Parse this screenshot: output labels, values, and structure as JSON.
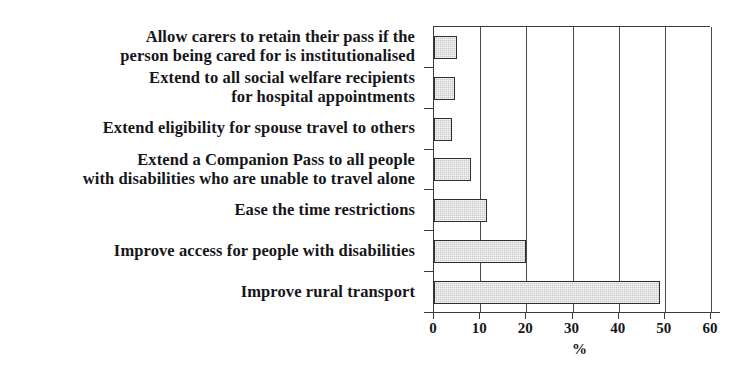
{
  "chart_data": {
    "type": "bar",
    "orientation": "horizontal",
    "title": "",
    "xlabel": "%",
    "ylabel": "",
    "xlim": [
      0,
      60
    ],
    "xticks": [
      0,
      10,
      20,
      30,
      40,
      50,
      60
    ],
    "xtick_labels": [
      "0",
      "10",
      "20",
      "30",
      "40",
      "50",
      "60"
    ],
    "grid": true,
    "grid_axis": "x",
    "legend": false,
    "categories": [
      "Allow carers to retain their pass if the person being cared for is institutionalised",
      "Extend to all social welfare recipients for hospital appointments",
      "Extend eligibility for spouse travel to others",
      "Extend a Companion Pass to all people with disabilities who are unable to travel alone",
      "Ease the time restrictions",
      "Improve access for people with disabilities",
      "Improve rural transport"
    ],
    "category_lines": [
      [
        "Allow carers to retain their pass if the",
        "person being cared for is institutionalised"
      ],
      [
        "Extend to all social welfare recipients",
        "for hospital appointments"
      ],
      [
        "Extend eligibility for spouse travel to others"
      ],
      [
        "Extend a Companion Pass to all people",
        "with disabilities who are unable to travel alone"
      ],
      [
        "Ease the time restrictions"
      ],
      [
        "Improve access for people with disabilities"
      ],
      [
        "Improve rural transport"
      ]
    ],
    "values": [
      5,
      4.5,
      4,
      8,
      11.5,
      20,
      49
    ],
    "bar_fill_color": "#c9c9c9",
    "bar_edge_color": "#2e2e2e",
    "axis_color": "#3a3a3a"
  }
}
